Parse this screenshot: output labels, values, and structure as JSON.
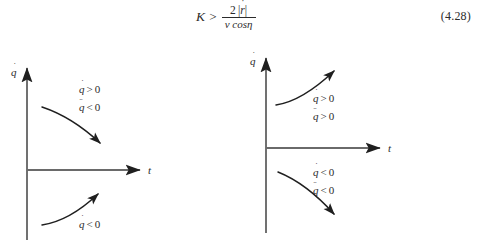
{
  "equation": {
    "label": "equation-4-28",
    "lhs": "K",
    "relation": ">",
    "numerator_prefix": "2",
    "numerator_var": "r",
    "numerator_dots": "˙",
    "denominator": "v cosη",
    "number": "(4.28)",
    "plain_text": "K > 2|ṙ| / (v cosη)"
  },
  "figures": [
    {
      "id": "figure-left",
      "y_axis_label": "q",
      "y_axis_dots": "˙",
      "x_axis_label": "t",
      "curves": [
        {
          "name": "upper-curve",
          "shape": "concave-decreasing",
          "quadrant": "above-axis",
          "direction": "right-down",
          "annotations": [
            {
              "var": "q",
              "dots": "˙",
              "relation": ">",
              "value": "0",
              "text": "q̇ > 0"
            },
            {
              "var": "q",
              "dots": "¨",
              "relation": "<",
              "value": "0",
              "text": "q̈ < 0"
            }
          ]
        },
        {
          "name": "lower-curve",
          "shape": "convex-increasing",
          "quadrant": "below-axis",
          "direction": "right-up",
          "annotations": [
            {
              "var": "q",
              "dots": "˙",
              "relation": "<",
              "value": "0",
              "text": "q̇ < 0"
            }
          ]
        }
      ]
    },
    {
      "id": "figure-right",
      "y_axis_label": "q",
      "y_axis_dots": "˙",
      "x_axis_label": "t",
      "curves": [
        {
          "name": "upper-curve",
          "shape": "convex-increasing",
          "quadrant": "above-axis",
          "direction": "right-up",
          "annotations": [
            {
              "var": "q",
              "dots": "˙",
              "relation": ">",
              "value": "0",
              "text": "q̇ > 0"
            },
            {
              "var": "q",
              "dots": "¨",
              "relation": ">",
              "value": "0",
              "text": "q̈ > 0"
            }
          ]
        },
        {
          "name": "lower-curve",
          "shape": "concave-decreasing",
          "quadrant": "below-axis",
          "direction": "right-down",
          "annotations": [
            {
              "var": "q",
              "dots": "˙",
              "relation": "<",
              "value": "0",
              "text": "q̇ < 0"
            },
            {
              "var": "q",
              "dots": "¨",
              "relation": "<",
              "value": "0",
              "text": "q̈ < 0"
            }
          ]
        }
      ]
    }
  ]
}
